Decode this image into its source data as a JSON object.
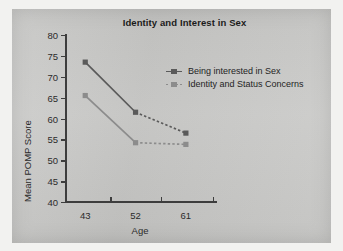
{
  "figure": {
    "background_color": "#c8c8c6",
    "page_color": "#f2f2f0"
  },
  "chart_data": {
    "type": "line",
    "title": "Identity and Interest in Sex",
    "xlabel": "Age",
    "ylabel": "Mean POMP Score",
    "categories": [
      "43",
      "52",
      "61"
    ],
    "x": [
      43,
      52,
      61
    ],
    "ylim": [
      40,
      80
    ],
    "yticks": [
      40,
      45,
      50,
      55,
      60,
      65,
      70,
      75,
      80
    ],
    "grid": false,
    "legend_position": "center-right",
    "series": [
      {
        "name": "Being interested in Sex",
        "values": [
          73.5,
          61.5,
          56.5
        ],
        "color": "#5a5a5a",
        "linestyle": "solid-then-dashed",
        "marker": "square"
      },
      {
        "name": "Identity and Status Concerns",
        "values": [
          65.5,
          54.2,
          53.8
        ],
        "color": "#8c8c8c",
        "linestyle": "solid-then-dashed",
        "marker": "square"
      }
    ]
  },
  "axis": {
    "y_tick_labels": [
      "80",
      "75",
      "70",
      "65",
      "60",
      "55",
      "50",
      "45",
      "40"
    ],
    "x_tick_labels": [
      "43",
      "52",
      "61"
    ]
  },
  "legend": {
    "items": [
      {
        "label": "Being interested in Sex"
      },
      {
        "label": "Identity and Status Concerns"
      }
    ]
  }
}
